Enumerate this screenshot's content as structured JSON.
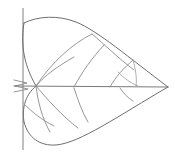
{
  "figure": {
    "style": "line drawing",
    "background_color": "#ffffff",
    "outline_color": "#6e6e6e",
    "vein_color": "#8a8a8a",
    "minor_vein_color": "#9a9a9a",
    "stem_color": "#8a8a8a",
    "width": 175,
    "height": 156,
    "caption": ""
  },
  "geometry": {
    "canvas": {
      "width": 175,
      "height": 156
    },
    "tip_point": {
      "x": 168,
      "y": 87
    },
    "base_junction": {
      "x": 36,
      "y": 86
    },
    "stem": {
      "name": "petiole",
      "path": "M 23 8 L 23 150"
    },
    "midrib": {
      "name": "midrib",
      "path": "M 14 86 L 168 87"
    },
    "base_notches": [
      {
        "name": "upper-notch",
        "path": "M 14 80 L 27 83 L 15 86"
      },
      {
        "name": "lower-notch",
        "path": "M 14 92 L 28 89 L 15 86"
      }
    ],
    "outline_upper": {
      "name": "upper-margin",
      "path": "M 24 23 C 38 16 58 15 76 22 C 98 31 128 57 168 87"
    },
    "outline_lower": {
      "name": "lower-margin",
      "path": "M 24 122 C 28 138 40 146 56 145 C 80 143 118 116 168 87"
    },
    "base_upper_connector": {
      "name": "upper-base-edge",
      "path": "M 24 23 C 21 40 22 62 36 86"
    },
    "base_lower_connector": {
      "name": "lower-base-edge",
      "path": "M 24 122 C 22 110 24 96 36 86"
    },
    "veins_upper": [
      {
        "name": "upper-vein-1",
        "path": "M 36 86 C 52 62 72 44 92 34"
      },
      {
        "name": "upper-vein-2",
        "path": "M 36 86 C 44 76 58 66 74 57"
      },
      {
        "name": "upper-vein-3",
        "path": "M 74 87 C 82 72 92 58 104 45"
      },
      {
        "name": "upper-vein-4",
        "path": "M 110 87 C 116 76 124 68 133 60"
      },
      {
        "name": "upper-vein-5",
        "path": "M 92 34 C 104 44 118 58 134 70"
      }
    ],
    "veins_lower": [
      {
        "name": "lower-vein-1",
        "path": "M 36 86 C 38 102 42 118 50 132"
      },
      {
        "name": "lower-vein-2",
        "path": "M 36 86 C 48 100 62 116 78 128"
      },
      {
        "name": "lower-vein-3",
        "path": "M 74 88 C 78 100 82 112 88 122"
      },
      {
        "name": "lower-vein-4",
        "path": "M 120 88 C 124 94 128 98 133 101"
      },
      {
        "name": "lower-vein-5",
        "path": "M 24 104 C 32 112 42 120 54 126"
      }
    ],
    "veins_minor": [
      {
        "name": "minor-vein-1",
        "path": "M 118 72 C 124 78 130 83 138 86"
      },
      {
        "name": "minor-vein-2",
        "path": "M 133 60 C 136 70 137 80 136 86"
      }
    ]
  },
  "labels": {
    "stem_label": "petiole",
    "midrib_label": "midrib",
    "tip_label": "apex",
    "base_label": "base",
    "margin_label": "margin"
  }
}
